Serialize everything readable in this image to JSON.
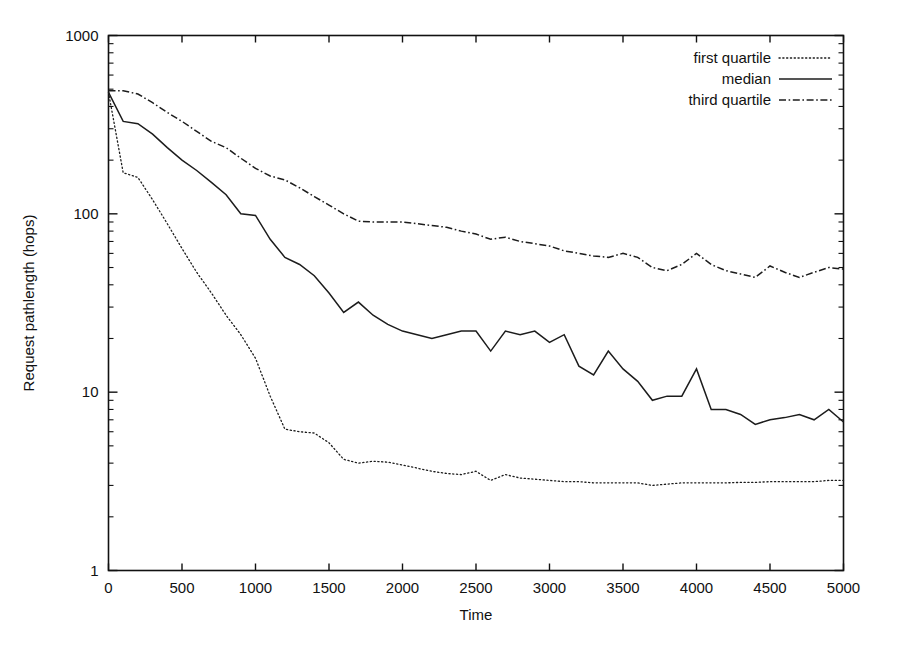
{
  "chart_data": {
    "type": "line",
    "title": "",
    "xlabel": "Time",
    "ylabel": "Request pathlength (hops)",
    "xlim": [
      0,
      5000
    ],
    "ylim": [
      1,
      1000
    ],
    "yscale": "log",
    "xscale": "linear",
    "grid": false,
    "legend_position": "top-right",
    "xticks": [
      0,
      500,
      1000,
      1500,
      2000,
      2500,
      3000,
      3500,
      4000,
      4500,
      5000
    ],
    "xtick_labels": [
      "0",
      "500",
      "1000",
      "1500",
      "2000",
      "2500",
      "3000",
      "3500",
      "4000",
      "4500",
      "5000"
    ],
    "yticks": [
      1,
      10,
      100,
      1000
    ],
    "ytick_labels": [
      "1",
      "10",
      "100",
      "1000"
    ],
    "x": [
      0,
      100,
      200,
      300,
      400,
      500,
      600,
      700,
      800,
      900,
      1000,
      1100,
      1200,
      1300,
      1400,
      1500,
      1600,
      1700,
      1800,
      1900,
      2000,
      2100,
      2200,
      2300,
      2400,
      2500,
      2600,
      2700,
      2800,
      2900,
      3000,
      3100,
      3200,
      3300,
      3400,
      3500,
      3600,
      3700,
      3800,
      3900,
      4000,
      4100,
      4200,
      4300,
      4400,
      4500,
      4600,
      4700,
      4800,
      4900,
      5000
    ],
    "series": [
      {
        "name": "first quartile",
        "style": "dotted",
        "values": [
          480,
          170,
          160,
          120,
          88,
          64,
          47,
          36,
          27,
          21,
          15.5,
          9.5,
          6.2,
          6.0,
          5.9,
          5.2,
          4.2,
          4.0,
          4.1,
          4.05,
          3.9,
          3.75,
          3.6,
          3.5,
          3.45,
          3.6,
          3.2,
          3.45,
          3.3,
          3.25,
          3.2,
          3.15,
          3.15,
          3.1,
          3.1,
          3.1,
          3.1,
          3.0,
          3.05,
          3.1,
          3.1,
          3.1,
          3.1,
          3.12,
          3.12,
          3.15,
          3.15,
          3.15,
          3.15,
          3.2,
          3.2
        ]
      },
      {
        "name": "median",
        "style": "solid",
        "values": [
          480,
          330,
          320,
          280,
          235,
          200,
          175,
          150,
          128,
          100,
          98,
          72,
          57,
          52,
          45,
          36,
          28,
          32,
          27,
          24,
          22,
          21,
          20,
          21,
          22,
          22,
          17,
          22,
          21,
          22,
          19,
          21,
          14,
          12.5,
          17,
          13.5,
          11.5,
          9,
          9.5,
          9.5,
          13.5,
          8,
          8,
          7.5,
          6.6,
          7,
          7.2,
          7.5,
          7,
          8,
          6.8
        ]
      },
      {
        "name": "third quartile",
        "style": "dash-dot",
        "values": [
          490,
          490,
          470,
          420,
          370,
          330,
          290,
          255,
          235,
          205,
          180,
          163,
          155,
          140,
          125,
          112,
          100,
          91,
          90,
          90,
          90,
          88,
          86,
          84,
          80,
          77,
          72,
          74,
          70,
          68,
          66,
          62,
          60,
          58,
          57,
          60,
          57,
          50,
          48,
          52,
          60,
          52,
          48,
          46,
          44,
          51,
          47,
          44,
          47,
          50,
          49
        ]
      }
    ],
    "legend": [
      {
        "label": "first quartile",
        "style": "dotted"
      },
      {
        "label": "median",
        "style": "solid"
      },
      {
        "label": "third quartile",
        "style": "dash-dot"
      }
    ]
  }
}
